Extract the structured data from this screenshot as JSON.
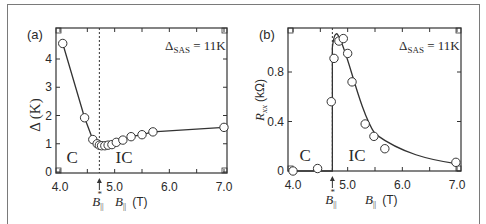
{
  "figure": {
    "panels": [
      {
        "label": "(a)",
        "annotation": "Δ",
        "annotation_sub": "SAS",
        "annotation_rest": " = 11K",
        "ylabel": "Δ (K)",
        "xlabel_main": "B",
        "xlabel_sub": "||",
        "xlabel_unit": "(T)",
        "critical_label": "B",
        "critical_sub": "||",
        "critical_sup": "*",
        "region_left": "C",
        "region_right": "IC"
      },
      {
        "label": "(b)",
        "annotation": "Δ",
        "annotation_sub": "SAS",
        "annotation_rest": " = 11K",
        "ylabel_main": "R",
        "ylabel_sub": "xx",
        "ylabel_unit": "(kΩ)",
        "xlabel_main": "B",
        "xlabel_sub": "||",
        "xlabel_unit": "(T)",
        "critical_label": "B",
        "critical_sub": "||",
        "critical_sup": "*",
        "region_left": "C",
        "region_right": "IC"
      }
    ]
  },
  "chart_data": [
    {
      "type": "line",
      "title": "(a)",
      "xlabel": "B|| (T)",
      "ylabel": "Δ (K)",
      "annotation": "ΔSAS = 11K",
      "xlim": [
        3.95,
        7.05
      ],
      "ylim": [
        -0.05,
        5.05
      ],
      "xticks": [
        "4.0",
        "5.0",
        "6.0",
        "7.0"
      ],
      "yticks": [
        "0",
        "1",
        "2",
        "3",
        "4"
      ],
      "critical_field": {
        "label": "B||*",
        "x": 4.72
      },
      "regions": [
        {
          "label": "C",
          "x": 4.3
        },
        {
          "label": "IC",
          "x": 5.2
        }
      ],
      "grid": false,
      "legend": "none",
      "series": [
        {
          "name": "Δ",
          "x": [
            4.05,
            4.45,
            4.6,
            4.68,
            4.72,
            4.76,
            4.82,
            4.88,
            4.95,
            5.03,
            5.15,
            5.3,
            5.5,
            5.7,
            7.0
          ],
          "values": [
            4.55,
            1.92,
            1.15,
            1.0,
            0.95,
            0.93,
            0.93,
            0.95,
            0.97,
            1.05,
            1.13,
            1.25,
            1.32,
            1.42,
            1.58
          ]
        }
      ]
    },
    {
      "type": "line",
      "title": "(b)",
      "xlabel": "B|| (T)",
      "ylabel": "Rxx (kΩ)",
      "annotation": "ΔSAS = 11K",
      "xlim": [
        3.95,
        7.05
      ],
      "ylim": [
        -0.02,
        1.15
      ],
      "xticks": [
        "4.0",
        "5.0",
        "6.0",
        "7.0"
      ],
      "yticks": [
        "0",
        "0.4",
        "0.8"
      ],
      "critical_field": {
        "label": "B||*",
        "x": 4.72
      },
      "regions": [
        {
          "label": "C",
          "x": 4.3
        },
        {
          "label": "IC",
          "x": 5.2
        }
      ],
      "grid": false,
      "legend": "none",
      "series": [
        {
          "name": "Rxx",
          "x": [
            4.0,
            4.45,
            4.7,
            4.75,
            4.84,
            4.92,
            5.0,
            5.08,
            5.32,
            5.48,
            5.68,
            6.98
          ],
          "values": [
            0.0,
            0.02,
            0.56,
            0.91,
            1.05,
            1.07,
            0.95,
            0.72,
            0.38,
            0.28,
            0.18,
            0.07
          ]
        }
      ]
    }
  ]
}
